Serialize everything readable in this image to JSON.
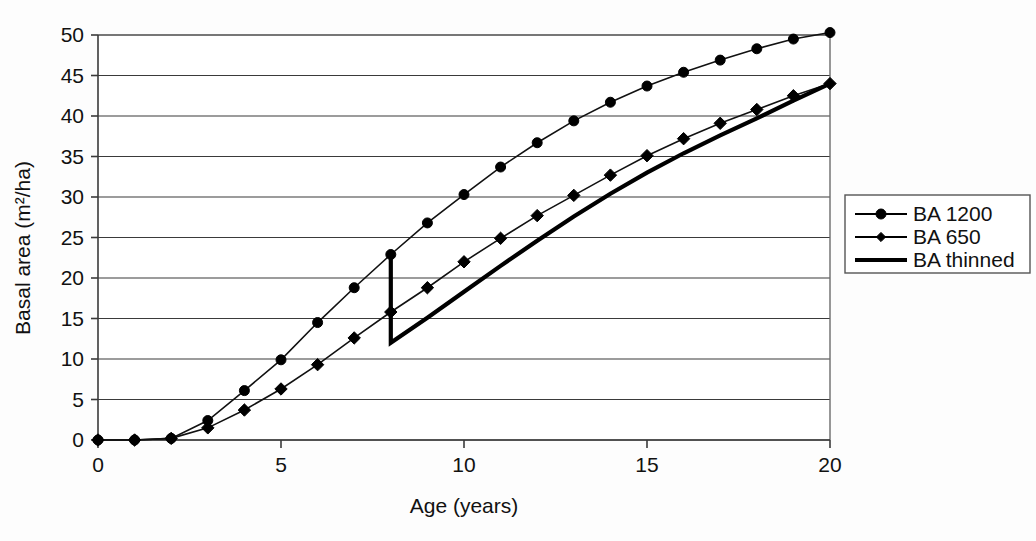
{
  "chart_data": {
    "type": "line",
    "title": "",
    "xlabel": "Age (years)",
    "ylabel": "Basal area (m²/ha)",
    "xlim": [
      0,
      20
    ],
    "ylim": [
      0,
      50
    ],
    "xticks": [
      "0",
      "5",
      "10",
      "15",
      "20"
    ],
    "xtick_values": [
      0,
      5,
      10,
      15,
      20
    ],
    "yticks": [
      "0",
      "5",
      "10",
      "15",
      "20",
      "25",
      "30",
      "35",
      "40",
      "45",
      "50"
    ],
    "ytick_values": [
      0,
      5,
      10,
      15,
      20,
      25,
      30,
      35,
      40,
      45,
      50
    ],
    "grid": "horizontal",
    "legend_position": "right",
    "x": [
      0,
      1,
      2,
      3,
      4,
      5,
      6,
      7,
      8,
      9,
      10,
      11,
      12,
      13,
      14,
      15,
      16,
      17,
      18,
      19,
      20
    ],
    "series": [
      {
        "name": "BA 1200",
        "marker": "circle",
        "values": [
          0,
          0,
          0.2,
          2.4,
          6.1,
          9.9,
          14.5,
          18.8,
          22.9,
          26.8,
          30.3,
          33.7,
          36.7,
          39.4,
          41.7,
          43.7,
          45.4,
          46.9,
          48.3,
          49.5,
          50.3
        ]
      },
      {
        "name": "BA 650",
        "marker": "diamond",
        "values": [
          0,
          0,
          0.2,
          1.5,
          3.7,
          6.3,
          9.3,
          12.6,
          15.8,
          18.8,
          22.0,
          24.9,
          27.7,
          30.2,
          32.7,
          35.1,
          37.2,
          39.1,
          40.8,
          42.5,
          44.0
        ]
      },
      {
        "name": "BA thinned",
        "marker": "none",
        "x": [
          8,
          8,
          9,
          10,
          11,
          12,
          13,
          14,
          15,
          16,
          17,
          18,
          19,
          20
        ],
        "values": [
          22.9,
          12.0,
          15.1,
          18.3,
          21.5,
          24.6,
          27.6,
          30.4,
          33.0,
          35.4,
          37.6,
          39.7,
          41.9,
          44.0
        ]
      }
    ],
    "legend": [
      {
        "label": "BA 1200",
        "marker": "circle",
        "line": "thin"
      },
      {
        "label": "BA 650",
        "marker": "diamond",
        "line": "thin"
      },
      {
        "label": "BA thinned",
        "marker": "none",
        "line": "thick"
      }
    ],
    "colors": {
      "series": "#000000",
      "grid": "#3a3a3a",
      "background": "#ffffff"
    },
    "annotations": [
      {
        "name": "thinning-drop",
        "age": 8,
        "from": 22.9,
        "to": 12.0
      }
    ]
  }
}
